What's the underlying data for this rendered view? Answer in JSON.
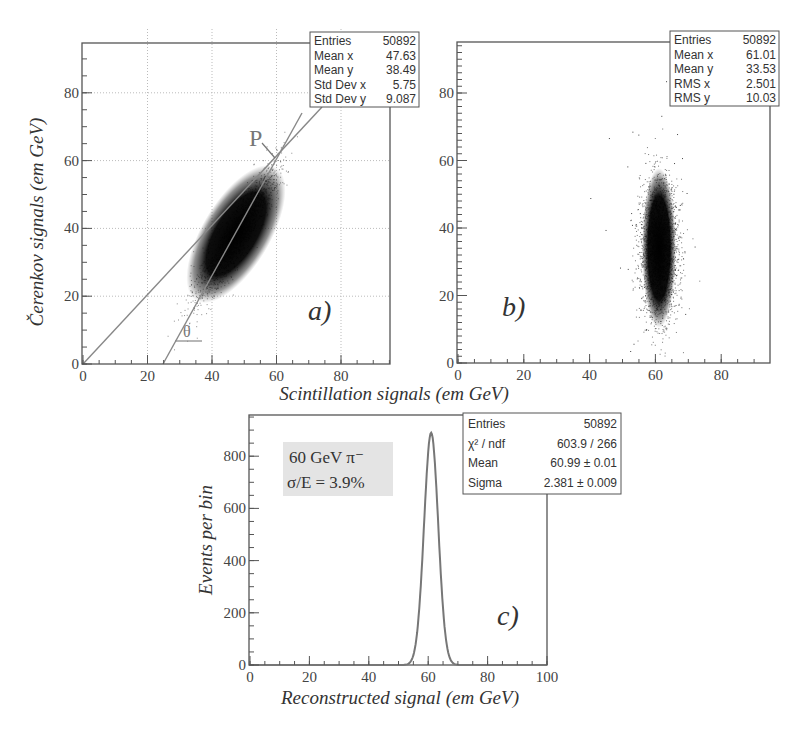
{
  "chart_data": [
    {
      "id": "a",
      "type": "scatter",
      "panel_label": "a)",
      "xlabel": "Scintillation signals (em GeV)",
      "ylabel": "Čerenkov signals (em GeV)",
      "xlim": [
        0,
        95
      ],
      "ylim": [
        0,
        95
      ],
      "x_ticks": [
        "0",
        "20",
        "40",
        "60",
        "80"
      ],
      "y_ticks": [
        "0",
        "20",
        "40",
        "60",
        "80"
      ],
      "grid": true,
      "stats": [
        {
          "label": "Entries",
          "value": "50892"
        },
        {
          "label": "Mean x",
          "value": "47.63"
        },
        {
          "label": "Mean y",
          "value": "38.49"
        },
        {
          "label": "Std Dev x",
          "value": "5.75"
        },
        {
          "label": "Std Dev y",
          "value": "9.087"
        }
      ],
      "annotations": [
        {
          "text": "P",
          "note": "intersection point at (60,60)"
        },
        {
          "text": "θ",
          "note": "angle of fitted line"
        }
      ],
      "lines": [
        {
          "name": "diagonal y=x",
          "from": [
            0,
            0
          ],
          "to": [
            68,
            68
          ]
        },
        {
          "name": "fit line",
          "from": [
            25,
            0
          ],
          "to": [
            68,
            74
          ]
        }
      ],
      "cluster": {
        "center_x": 47.63,
        "center_y": 38.49,
        "sd_x": 5.75,
        "sd_y": 9.087,
        "entries": 50892
      }
    },
    {
      "id": "b",
      "type": "scatter",
      "panel_label": "b)",
      "xlim": [
        0,
        95
      ],
      "ylim": [
        0,
        95
      ],
      "x_ticks": [
        "0",
        "20",
        "40",
        "60",
        "80"
      ],
      "y_ticks": [
        "0",
        "20",
        "40",
        "60",
        "80"
      ],
      "grid": false,
      "stats": [
        {
          "label": "Entries",
          "value": "50892"
        },
        {
          "label": "Mean x",
          "value": "61.01"
        },
        {
          "label": "Mean y",
          "value": "33.53"
        },
        {
          "label": "RMS x",
          "value": "2.501"
        },
        {
          "label": "RMS y",
          "value": "10.03"
        }
      ],
      "cluster": {
        "center_x": 61.01,
        "center_y": 33.53,
        "sd_x": 2.501,
        "sd_y": 10.03,
        "entries": 50892
      }
    },
    {
      "id": "c",
      "type": "line",
      "panel_label": "c)",
      "xlabel": "Reconstructed signal (em GeV)",
      "ylabel": "Events per bin",
      "xlim": [
        0,
        100
      ],
      "ylim": [
        0,
        950
      ],
      "x_ticks": [
        "0",
        "20",
        "40",
        "60",
        "80",
        "100"
      ],
      "y_ticks": [
        "0",
        "200",
        "400",
        "600",
        "800"
      ],
      "grid": false,
      "legend_box": [
        "60 GeV π⁻",
        "σ/E = 3.9%"
      ],
      "stats": [
        {
          "label": "Entries",
          "value": "50892"
        },
        {
          "label": "χ² / ndf",
          "value": "603.9 / 266"
        },
        {
          "label": "Mean",
          "value": "60.99 ± 0.01"
        },
        {
          "label": "Sigma",
          "value": "2.381 ± 0.009"
        }
      ],
      "series": [
        {
          "name": "Gaussian peak",
          "mean": 60.99,
          "sigma": 2.381,
          "peak": 890,
          "x": [
            50,
            52,
            54,
            55,
            56,
            57,
            58,
            59,
            60,
            60.5,
            61,
            61.5,
            62,
            63,
            64,
            65,
            66,
            67,
            68,
            70,
            72
          ],
          "y": [
            0,
            3,
            20,
            45,
            105,
            205,
            395,
            600,
            790,
            870,
            890,
            870,
            800,
            620,
            400,
            210,
            100,
            45,
            18,
            3,
            0
          ]
        }
      ]
    }
  ]
}
